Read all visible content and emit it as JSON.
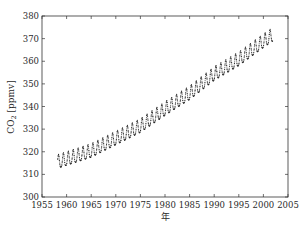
{
  "chart_data": {
    "type": "line",
    "title": "",
    "xlabel": "年",
    "ylabel": "CO₂ [ppmv]",
    "xlim": [
      1955,
      2005
    ],
    "ylim": [
      300,
      380
    ],
    "grid": false,
    "legend": null,
    "x_ticks": [
      1955,
      1960,
      1965,
      1970,
      1975,
      1980,
      1985,
      1990,
      1995,
      2000,
      2005
    ],
    "y_ticks": [
      300,
      310,
      320,
      330,
      340,
      350,
      360,
      370,
      380
    ],
    "series": [
      {
        "name": "CO₂ monthly mean (Mauna Loa)",
        "style": "dotted line with point markers",
        "color": "#222222",
        "x_range": [
          1958.2,
          2001.9
        ],
        "model": {
          "description": "quadratic trend + annual seasonal cycle",
          "trend_points": [
            {
              "year": 1958,
              "ppmv": 315.0
            },
            {
              "year": 1965,
              "ppmv": 320.0
            },
            {
              "year": 1970,
              "ppmv": 325.5
            },
            {
              "year": 1975,
              "ppmv": 331.0
            },
            {
              "year": 1980,
              "ppmv": 338.5
            },
            {
              "year": 1985,
              "ppmv": 345.5
            },
            {
              "year": 1990,
              "ppmv": 354.0
            },
            {
              "year": 1995,
              "ppmv": 360.5
            },
            {
              "year": 2000,
              "ppmv": 368.5
            },
            {
              "year": 2002,
              "ppmv": 371.5
            }
          ],
          "seasonal_amplitude_ppmv": 3.0
        }
      }
    ]
  },
  "axes": {
    "x_tick_labels": [
      "1955",
      "1960",
      "1965",
      "1970",
      "1975",
      "1980",
      "1985",
      "1990",
      "1995",
      "2000",
      "2005"
    ],
    "y_tick_labels": [
      "300",
      "310",
      "320",
      "330",
      "340",
      "350",
      "360",
      "370",
      "380"
    ],
    "xlabel": "年",
    "ylabel_main": "CO",
    "ylabel_sub": "2",
    "ylabel_unit": " [ppmv]"
  }
}
